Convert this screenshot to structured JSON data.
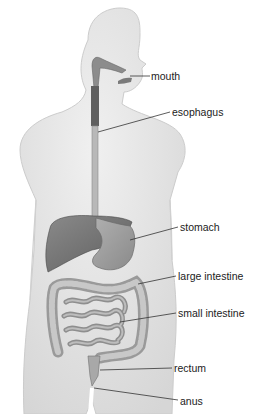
{
  "diagram": {
    "colors": {
      "body_fill": "#e6e6e6",
      "body_edge": "#c9c9c9",
      "organ_dark": "#7d7d7d",
      "organ_mid": "#a6a6a6",
      "organ_light": "#c4c4c4",
      "leader_line": "#333333",
      "label_text": "#222222"
    },
    "labels": [
      {
        "id": "mouth",
        "text": "mouth",
        "x": 151,
        "y": 70
      },
      {
        "id": "esophagus",
        "text": "esophagus",
        "x": 172,
        "y": 106
      },
      {
        "id": "stomach",
        "text": "stomach",
        "x": 180,
        "y": 221
      },
      {
        "id": "large-intestine",
        "text": "large intestine",
        "x": 178,
        "y": 270
      },
      {
        "id": "small-intestine",
        "text": "small intestine",
        "x": 178,
        "y": 307
      },
      {
        "id": "rectum",
        "text": "rectum",
        "x": 174,
        "y": 362
      },
      {
        "id": "anus",
        "text": "anus",
        "x": 180,
        "y": 395
      }
    ]
  }
}
